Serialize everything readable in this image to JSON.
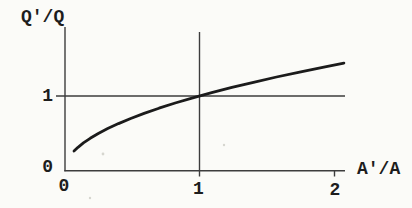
{
  "figure": {
    "background": "#fbfbf8",
    "text_color": "#1d1d1d",
    "axis_color": "#3d3d3d",
    "curve_color": "#1b1b1b"
  },
  "chart_data": {
    "type": "line",
    "title": "",
    "xlabel": "A'/A",
    "ylabel": "Q'/Q",
    "xlim": [
      0,
      2.1
    ],
    "ylim": [
      0,
      1.95
    ],
    "grid": false,
    "legend": null,
    "x_ticks": [
      {
        "value": 0,
        "label": "0"
      },
      {
        "value": 1,
        "label": "1"
      },
      {
        "value": 2,
        "label": "2"
      }
    ],
    "y_ticks": [
      {
        "value": 0,
        "label": "0"
      },
      {
        "value": 1,
        "label": "1"
      }
    ],
    "reference_lines": [
      {
        "axis": "x",
        "value": 1
      },
      {
        "axis": "y",
        "value": 1
      }
    ],
    "series": [
      {
        "name": "Q'/Q versus A'/A (square-root curve through (1,1))",
        "x": [
          0.07,
          0.1,
          0.14,
          0.19,
          0.25,
          0.32,
          0.4,
          0.49,
          0.59,
          0.7,
          0.82,
          0.95,
          1.09,
          1.24,
          1.4,
          1.57,
          1.75,
          1.93,
          2.07
        ],
        "y": [
          0.265,
          0.316,
          0.374,
          0.436,
          0.5,
          0.566,
          0.632,
          0.7,
          0.768,
          0.837,
          0.906,
          0.975,
          1.044,
          1.114,
          1.183,
          1.253,
          1.323,
          1.389,
          1.439
        ]
      }
    ]
  }
}
